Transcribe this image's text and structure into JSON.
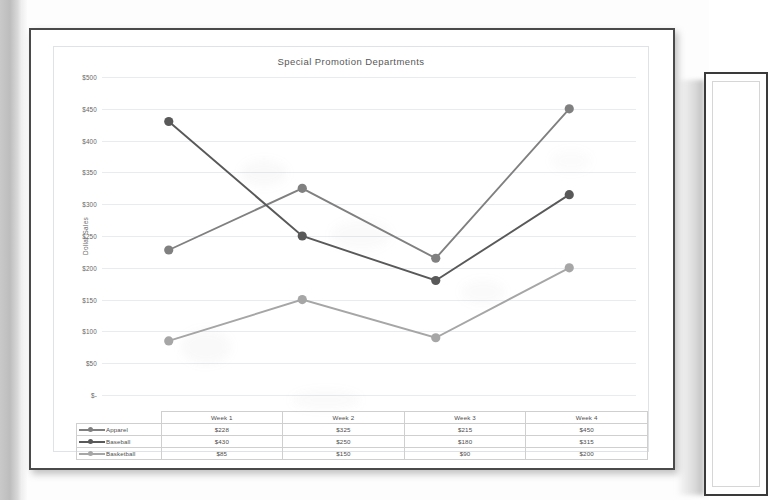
{
  "chart_data": {
    "type": "line",
    "title": "Special Promotion Departments",
    "xlabel": "",
    "ylabel": "Dollar Sales",
    "categories": [
      "Week 1",
      "Week 2",
      "Week 3",
      "Week 4"
    ],
    "ylim": [
      0,
      500
    ],
    "ytick_step": 50,
    "ytick_labels": [
      "$500",
      "$450",
      "$400",
      "$350",
      "$300",
      "$250",
      "$200",
      "$150",
      "$100",
      "$50",
      "$-"
    ],
    "ytick_values": [
      500,
      450,
      400,
      350,
      300,
      250,
      200,
      150,
      100,
      50,
      0
    ],
    "grid": true,
    "legend_position": "table-left",
    "series": [
      {
        "name": "Apparel",
        "values": [
          228,
          325,
          215,
          450
        ],
        "labels": [
          "$228",
          "$325",
          "$215",
          "$450"
        ],
        "color": "#808080"
      },
      {
        "name": "Baseball",
        "values": [
          430,
          250,
          180,
          315
        ],
        "labels": [
          "$430",
          "$250",
          "$180",
          "$315"
        ],
        "color": "#595959"
      },
      {
        "name": "Basketball",
        "values": [
          85,
          150,
          90,
          200
        ],
        "labels": [
          "$85",
          "$150",
          "$90",
          "$200"
        ],
        "color": "#a6a6a6"
      }
    ]
  },
  "table": {
    "corner": "",
    "headers": [
      "Week 1",
      "Week 2",
      "Week 3",
      "Week 4"
    ],
    "rows": [
      {
        "label": "Apparel",
        "cells": [
          "$228",
          "$325",
          "$215",
          "$450"
        ]
      },
      {
        "label": "Baseball",
        "cells": [
          "$430",
          "$250",
          "$180",
          "$315"
        ]
      },
      {
        "label": "Basketball",
        "cells": [
          "$85",
          "$150",
          "$90",
          "$200"
        ]
      }
    ]
  },
  "colors": {
    "apparel": "#808080",
    "baseball": "#595959",
    "basketball": "#a6a6a6",
    "grid": "#e9ecef",
    "page_border": "#4a4a4a",
    "text": "#585858"
  }
}
